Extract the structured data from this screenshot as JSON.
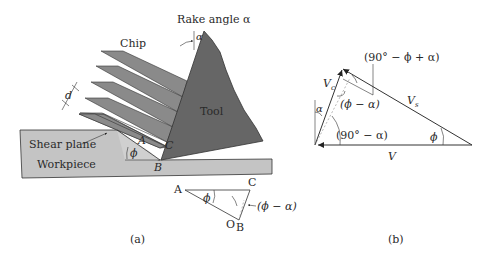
{
  "figure": {
    "panel_a": {
      "caption": "(a)",
      "labels": {
        "rake_angle": "Rake angle α",
        "alpha_tool": "α",
        "chip": "Chip",
        "tool": "Tool",
        "d": "d",
        "shear_plane": "Shear plane",
        "workpiece": "Workpiece",
        "A": "A",
        "B": "B",
        "C": "C",
        "phi": "ϕ"
      },
      "inset": {
        "A": "A",
        "C": "C",
        "O": "O",
        "B": "B",
        "phi": "ϕ",
        "phi_minus_alpha": "(ϕ − α)"
      },
      "colors": {
        "tool": "#666666",
        "chip": "#8a8a8a",
        "workpiece": "#c4c4c4",
        "outline": "#333333"
      }
    },
    "panel_b": {
      "caption": "(b)",
      "labels": {
        "Vc": "Vc",
        "Vc_main": "V",
        "Vc_sub": "c",
        "Vs_main": "V",
        "Vs_sub": "s",
        "V": "V",
        "alpha": "α",
        "phi": "ϕ",
        "angle_90_minus_phi_plus_alpha": "(90° − ϕ + α)",
        "angle_phi_minus_alpha": "(ϕ − α)",
        "angle_90_minus_alpha": "(90° − α)"
      }
    }
  }
}
